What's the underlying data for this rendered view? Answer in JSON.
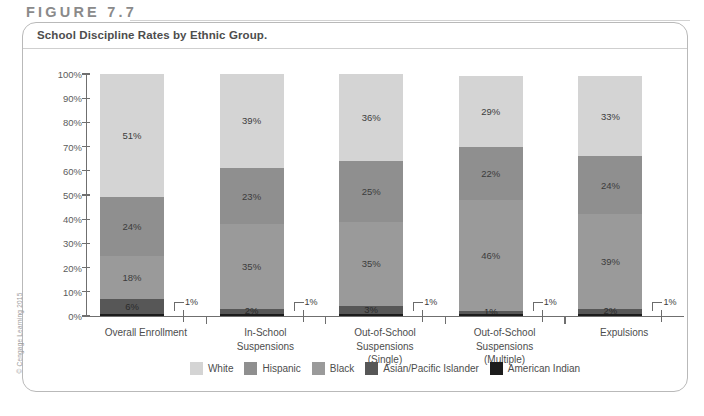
{
  "figure": {
    "label": "FIGURE 7.7",
    "title": "School Discipline Rates by Ethnic Group.",
    "copyright": "© Cengage Learning 2015"
  },
  "chart_data": {
    "type": "bar",
    "title": "School Discipline Rates by Ethnic Group.",
    "subtype": "stacked-100-percent",
    "xlabel": "",
    "ylabel": "",
    "ylim": [
      0,
      100
    ],
    "grid": false,
    "legend_position": "bottom",
    "categories": [
      "Overall Enrollment",
      "In-School\nSuspensions",
      "Out-of-School\nSuspensions\n(Single)",
      "Out-of-School\nSuspensions\n(Multiple)",
      "Expulsions"
    ],
    "tick_labels": [
      "0%",
      "10%",
      "20%",
      "30%",
      "40%",
      "50%",
      "60%",
      "70%",
      "80%",
      "90%",
      "100%"
    ],
    "series": [
      {
        "name": "American Indian",
        "color": "#1c1c1c",
        "values": [
          1,
          1,
          1,
          1,
          1
        ],
        "labels": [
          "1%",
          "1%",
          "1%",
          "1%",
          "1%"
        ],
        "callout": true
      },
      {
        "name": "Asian/Pacific Islander",
        "color": "#575757",
        "values": [
          6,
          2,
          3,
          1,
          2
        ],
        "labels": [
          "6%",
          "2%",
          "3%",
          "1%",
          "2%"
        ]
      },
      {
        "name": "Black",
        "color": "#9a9a9a",
        "values": [
          18,
          35,
          35,
          46,
          39
        ],
        "labels": [
          "18%",
          "35%",
          "35%",
          "46%",
          "39%"
        ]
      },
      {
        "name": "Hispanic",
        "color": "#8f8f8f",
        "values": [
          24,
          23,
          25,
          22,
          24
        ],
        "labels": [
          "24%",
          "23%",
          "25%",
          "22%",
          "24%"
        ]
      },
      {
        "name": "White",
        "color": "#d4d4d4",
        "values": [
          51,
          39,
          36,
          29,
          33
        ],
        "labels": [
          "51%",
          "39%",
          "36%",
          "29%",
          "33%"
        ]
      }
    ],
    "legend": [
      {
        "label": "White",
        "color": "#d4d4d4"
      },
      {
        "label": "Hispanic",
        "color": "#8f8f8f"
      },
      {
        "label": "Black",
        "color": "#9a9a9a"
      },
      {
        "label": "Asian/Pacific Islander",
        "color": "#575757"
      },
      {
        "label": "American Indian",
        "color": "#1c1c1c"
      }
    ]
  }
}
